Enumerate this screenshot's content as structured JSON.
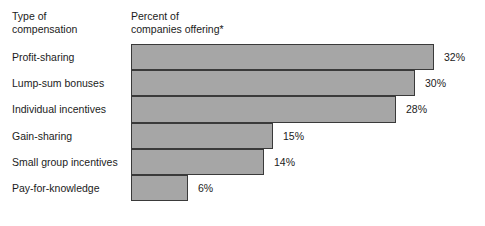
{
  "headers": {
    "category_column": "Type of\ncompensation",
    "value_column": "Percent of\ncompanies offering*"
  },
  "colors": {
    "bar_fill": "#a6a6a6",
    "bar_border": "#3a3a3a",
    "text": "#1b1b1b",
    "background": "#ffffff"
  },
  "chart_data": {
    "type": "bar",
    "orientation": "horizontal",
    "title": "",
    "xlabel": "Percent of companies offering*",
    "ylabel": "Type of compensation",
    "categories": [
      "Profit-sharing",
      "Lump-sum bonuses",
      "Individual incentives",
      "Gain-sharing",
      "Small group incentives",
      "Pay-for-knowledge"
    ],
    "values": [
      32,
      30,
      28,
      15,
      14,
      6
    ],
    "value_labels": [
      "32%",
      "30%",
      "28%",
      "15%",
      "14%",
      "6%"
    ],
    "xlim": [
      0,
      36
    ],
    "grid": false,
    "legend": false
  }
}
